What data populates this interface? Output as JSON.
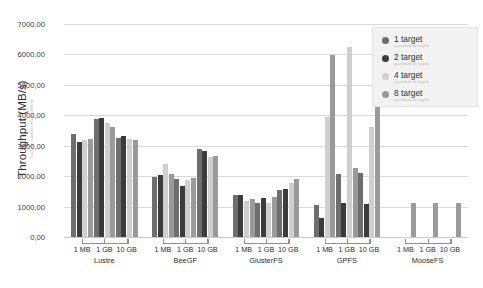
{
  "chart_data": {
    "type": "bar",
    "title": "",
    "xlabel": "",
    "ylabel": "Throughput (MB/s)",
    "ylabel_sub": "Taxa de transferência (MB/s)",
    "ylim": [
      0,
      7000
    ],
    "ytick_labels": [
      "0,00",
      "1000,00",
      "2000,00",
      "3000,00",
      "4000,00",
      "5000,00",
      "6000,00",
      "7000,00"
    ],
    "ytick_values": [
      0,
      1000,
      2000,
      3000,
      4000,
      5000,
      6000,
      7000
    ],
    "grid": true,
    "legend_position": "top-right",
    "block_sizes": [
      "1 MB",
      "1 GB",
      "10 GB"
    ],
    "groups": [
      "Lustre",
      "BeeGF",
      "GlusterFS",
      "GPFS",
      "MooseFS"
    ],
    "categories": [
      "Lustre 1 MB",
      "Lustre 1 GB",
      "Lustre 10 GB",
      "BeeGF 1 MB",
      "BeeGF 1 GB",
      "BeeGF 10 GB",
      "GlusterFS 1 MB",
      "GlusterFS 1 GB",
      "GlusterFS 10 GB",
      "GPFS 1 MB",
      "GPFS 1 GB",
      "GPFS 10 GB",
      "MooseFS 1 MB",
      "MooseFS 1 GB",
      "MooseFS 10 GB"
    ],
    "series": [
      {
        "name": "1 target",
        "sub": "quantidade de targets",
        "color": "#6e6e6e",
        "values": [
          3380,
          3870,
          3250,
          1980,
          1920,
          2880,
          1390,
          1130,
          1540,
          1060,
          2070,
          2110,
          null,
          null,
          null
        ]
      },
      {
        "name": "2 target",
        "sub": "quantidade de targets",
        "color": "#3c3c3c",
        "values": [
          3130,
          3900,
          3310,
          2030,
          1690,
          2820,
          1370,
          1270,
          1590,
          640,
          1120,
          1100,
          null,
          null,
          null
        ]
      },
      {
        "name": "4 target",
        "sub": "quantidade de targets",
        "color": "#cfcfcf",
        "values": [
          3200,
          3750,
          3230,
          2390,
          1880,
          2640,
          1200,
          1110,
          1790,
          3940,
          6250,
          3610,
          null,
          null,
          null
        ]
      },
      {
        "name": "8 target",
        "sub": "quantidade de targets",
        "color": "#9a9a9a",
        "values": [
          3230,
          3620,
          3200,
          2060,
          1930,
          2650,
          1240,
          1330,
          1910,
          5990,
          2280,
          4420,
          1110,
          1110,
          1110
        ]
      }
    ]
  },
  "legend": {
    "items": [
      {
        "label": "1 target",
        "sub": "quantidade de targets",
        "color": "#6e6e6e"
      },
      {
        "label": "2 target",
        "sub": "quantidade de targets",
        "color": "#3c3c3c"
      },
      {
        "label": "4 target",
        "sub": "quantidade de targets",
        "color": "#cfcfcf"
      },
      {
        "label": "8 target",
        "sub": "quantidade de targets",
        "color": "#9a9a9a"
      }
    ]
  }
}
